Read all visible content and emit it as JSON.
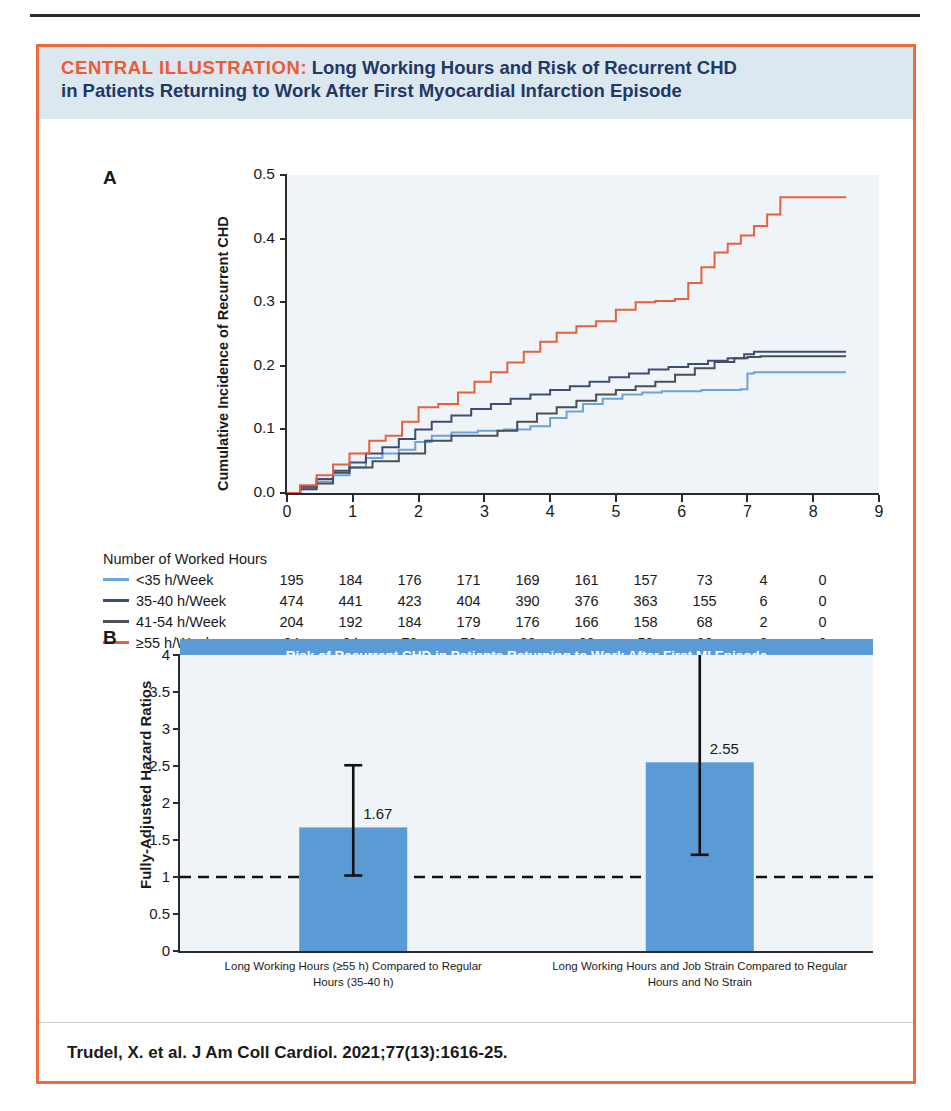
{
  "banner": {
    "tag": "CENTRAL ILLUSTRATION:",
    "title_line1": "Long Working Hours and Risk of Recurrent CHD",
    "title_line2": "in Patients Returning to Work After First Myocardial Infarction Episode"
  },
  "panels": {
    "a_letter": "A",
    "b_letter": "B"
  },
  "citation": "Trudel, X. et al. J Am Coll Cardiol. 2021;77(13):1616-25.",
  "colors": {
    "border": "#ef6a3d",
    "banner_bg": "#dce8f0",
    "banner_tag": "#ef5a32",
    "banner_title": "#1f3864",
    "plot_bg": "#eef4f7",
    "bar_blue": "#5b9bd5",
    "b_banner_bg": "#5b9bd5",
    "series_lt35": "#6ba3dd",
    "series_35_40": "#3e4d78",
    "series_41_54": "#4a4f55",
    "series_55plus": "#e8603c",
    "axis": "#2b2b2b"
  },
  "risk_table": {
    "title": "Number of Worked Hours",
    "rows": [
      {
        "label": "<35 h/Week",
        "color": "#6ba3dd",
        "values": [
          195,
          184,
          176,
          171,
          169,
          161,
          157,
          73,
          4,
          0
        ]
      },
      {
        "label": "35-40 h/Week",
        "color": "#3e4d78",
        "values": [
          474,
          441,
          423,
          404,
          390,
          376,
          363,
          155,
          6,
          0
        ]
      },
      {
        "label": "41-54 h/Week",
        "color": "#4a4f55",
        "values": [
          204,
          192,
          184,
          179,
          176,
          166,
          158,
          68,
          2,
          0
        ]
      },
      {
        "label": "≥55 h/Week",
        "color": "#e8603c",
        "values": [
          94,
          84,
          79,
          72,
          66,
          62,
          59,
          26,
          2,
          0
        ]
      }
    ]
  },
  "chart_data": [
    {
      "type": "line",
      "panel": "A",
      "title": "",
      "xlabel": "",
      "ylabel": "Cumulative Incidence of Recurrent CHD",
      "xlim": [
        0,
        9
      ],
      "ylim": [
        0,
        0.5
      ],
      "xticks": [
        0,
        1,
        2,
        3,
        4,
        5,
        6,
        7,
        8,
        9
      ],
      "yticks": [
        "0.0",
        "0.1",
        "0.2",
        "0.3",
        "0.4",
        "0.5"
      ],
      "grid": false,
      "legend_position": "below-axis-risk-table",
      "step": true,
      "series": [
        {
          "name": "<35 h/Week",
          "color": "#6ba3dd",
          "x": [
            0,
            0.2,
            0.45,
            0.7,
            0.95,
            1.2,
            1.45,
            1.7,
            1.95,
            2.2,
            2.5,
            2.9,
            3.3,
            3.7,
            4.0,
            4.25,
            4.5,
            4.8,
            5.1,
            5.4,
            5.7,
            6.0,
            6.3,
            6.6,
            6.9,
            7.0,
            7.1,
            8.5
          ],
          "y": [
            0.0,
            0.008,
            0.018,
            0.028,
            0.04,
            0.055,
            0.062,
            0.068,
            0.08,
            0.09,
            0.095,
            0.098,
            0.1,
            0.105,
            0.118,
            0.128,
            0.14,
            0.148,
            0.155,
            0.158,
            0.16,
            0.16,
            0.162,
            0.162,
            0.163,
            0.188,
            0.19,
            0.19
          ]
        },
        {
          "name": "35-40 h/Week",
          "color": "#3e4d78",
          "x": [
            0,
            0.2,
            0.45,
            0.7,
            0.95,
            1.2,
            1.45,
            1.7,
            1.95,
            2.2,
            2.5,
            2.8,
            3.1,
            3.4,
            3.7,
            4.0,
            4.3,
            4.6,
            4.9,
            5.2,
            5.5,
            5.8,
            6.1,
            6.4,
            6.7,
            6.95,
            7.1,
            7.6,
            8.5
          ],
          "y": [
            0.0,
            0.01,
            0.022,
            0.035,
            0.048,
            0.062,
            0.072,
            0.085,
            0.1,
            0.112,
            0.122,
            0.132,
            0.14,
            0.148,
            0.155,
            0.162,
            0.168,
            0.175,
            0.182,
            0.188,
            0.194,
            0.198,
            0.203,
            0.208,
            0.212,
            0.218,
            0.222,
            0.222,
            0.222
          ]
        },
        {
          "name": "41-54 h/Week",
          "color": "#4a4f55",
          "x": [
            0,
            0.2,
            0.45,
            0.7,
            0.95,
            1.3,
            1.7,
            2.1,
            2.5,
            2.9,
            3.2,
            3.5,
            3.8,
            4.1,
            4.4,
            4.7,
            5.0,
            5.3,
            5.6,
            5.9,
            6.2,
            6.5,
            6.8,
            7.0,
            7.2,
            8.5
          ],
          "y": [
            0.0,
            0.006,
            0.015,
            0.032,
            0.04,
            0.05,
            0.062,
            0.082,
            0.09,
            0.09,
            0.098,
            0.112,
            0.125,
            0.135,
            0.145,
            0.155,
            0.162,
            0.168,
            0.175,
            0.186,
            0.196,
            0.206,
            0.212,
            0.214,
            0.215,
            0.215
          ]
        },
        {
          "name": "≥55 h/Week",
          "color": "#e8603c",
          "x": [
            0,
            0.2,
            0.45,
            0.7,
            0.95,
            1.25,
            1.5,
            1.75,
            2.0,
            2.3,
            2.6,
            2.85,
            3.1,
            3.35,
            3.6,
            3.85,
            4.1,
            4.4,
            4.7,
            5.0,
            5.3,
            5.6,
            5.9,
            6.1,
            6.3,
            6.5,
            6.7,
            6.9,
            7.1,
            7.3,
            7.5,
            8.5
          ],
          "y": [
            0.0,
            0.012,
            0.028,
            0.045,
            0.062,
            0.082,
            0.09,
            0.112,
            0.135,
            0.14,
            0.158,
            0.175,
            0.19,
            0.205,
            0.222,
            0.238,
            0.252,
            0.262,
            0.27,
            0.288,
            0.3,
            0.302,
            0.305,
            0.33,
            0.355,
            0.378,
            0.392,
            0.405,
            0.42,
            0.438,
            0.465,
            0.465
          ]
        }
      ]
    },
    {
      "type": "bar",
      "panel": "B",
      "title": "Risk of Recurrent CHD in Patients Returning to Work After First MI Episode",
      "xlabel": "",
      "ylabel": "Fully-Adjusted Hazard Ratios",
      "ylim": [
        0,
        4
      ],
      "yticks": [
        "0",
        "0.5",
        "1",
        "1.5",
        "2",
        "2.5",
        "3",
        "3.5",
        "4"
      ],
      "reference_line": 1,
      "grid": false,
      "categories": [
        "Long Working Hours (≥55 h) Compared to Regular Hours (35-40 h)",
        "Long Working Hours and Job Strain Compared to Regular Hours and No Strain"
      ],
      "category_lines": [
        [
          "Long Working Hours (≥55 h) Compared to Regular",
          "Hours (35-40 h)"
        ],
        [
          "Long Working Hours and Job Strain Compared to Regular",
          "Hours and No Strain"
        ]
      ],
      "values": [
        1.67,
        2.55
      ],
      "value_labels": [
        "1.67",
        "2.55"
      ],
      "ci_low": [
        1.02,
        1.3
      ],
      "ci_high": [
        2.51,
        4.35
      ]
    }
  ]
}
